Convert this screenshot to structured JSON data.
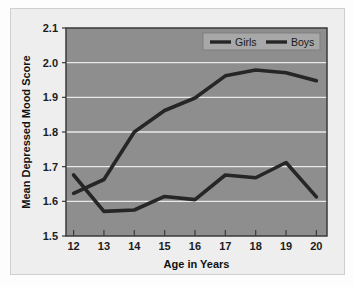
{
  "figure": {
    "background_color": "#fdfdfd",
    "panel_color": "#eeeeee",
    "panel_border_color": "#cfcfcf"
  },
  "chart_data": {
    "type": "line",
    "title": "",
    "xlabel": "Age in Years",
    "ylabel": "Mean Depressed Mood Score",
    "x": [
      12,
      13,
      14,
      15,
      16,
      17,
      18,
      19,
      20
    ],
    "xlim": [
      11.75,
      20.35
    ],
    "ylim": [
      1.5,
      2.1
    ],
    "yticks": [
      "1.5",
      "1.6",
      "1.7",
      "1.8",
      "1.9",
      "2.0",
      "2.1"
    ],
    "xticks": [
      "12",
      "13",
      "14",
      "15",
      "16",
      "17",
      "18",
      "19",
      "20"
    ],
    "grid": true,
    "grid_color": "#e8e8e8",
    "plot_background": "#8e8e8e",
    "line_color": "#262626",
    "legend_position": "top-right",
    "legend_background": "#a8a8a8",
    "series": [
      {
        "name": "Girls",
        "values": [
          1.623,
          1.663,
          1.8,
          1.862,
          1.898,
          1.962,
          1.979,
          1.971,
          1.948
        ]
      },
      {
        "name": "Boys",
        "values": [
          1.676,
          1.571,
          1.575,
          1.614,
          1.605,
          1.676,
          1.668,
          1.712,
          1.613
        ]
      }
    ]
  },
  "legend": {
    "entries": [
      {
        "label": "Girls"
      },
      {
        "label": "Boys"
      }
    ]
  }
}
